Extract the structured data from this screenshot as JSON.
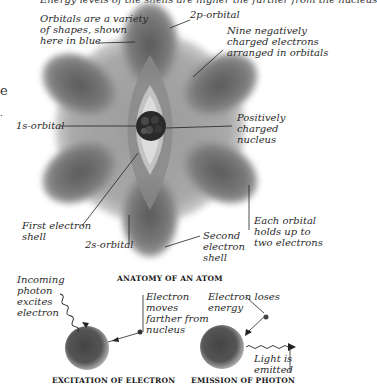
{
  "top_cut_text": "Energy levels of the shells are higher the further from the nucleus",
  "left_edge": {
    "char1": "e",
    "char2": "."
  },
  "anatomy": {
    "caption": "ANATOMY OF AN ATOM",
    "labels": {
      "orbitals_variety": [
        "Orbitals are a variety",
        "of shapes, shown",
        "here in blue"
      ],
      "p2_orbital": "2p-orbital",
      "nine_electrons": [
        "Nine negatively",
        "charged electrons",
        "arranged in orbitals"
      ],
      "s1_orbital": "1s-orbital",
      "nucleus": [
        "Positively",
        "charged",
        "nucleus"
      ],
      "first_shell": [
        "First electron",
        "shell"
      ],
      "s2_orbital": "2s-orbital",
      "second_shell": [
        "Second",
        "electron",
        "shell"
      ],
      "each_orbital": [
        "Each orbital",
        "holds up to",
        "two electrons"
      ]
    }
  },
  "excitation": {
    "caption": "EXCITATION OF ELECTRON",
    "labels": {
      "incoming": [
        "Incoming",
        "photon",
        "excites",
        "electron"
      ],
      "moves": [
        "Electron",
        "moves",
        "farther from",
        "nucleus"
      ]
    }
  },
  "emission": {
    "caption": "EMISSION OF PHOTON",
    "labels": {
      "loses": [
        "Electron loses",
        "energy"
      ],
      "light": [
        "Light is",
        "emitted"
      ]
    }
  },
  "colors": {
    "orbital_gray": "#6f6f6f",
    "nucleus": "#2a2a2a",
    "ink": "#222222"
  }
}
